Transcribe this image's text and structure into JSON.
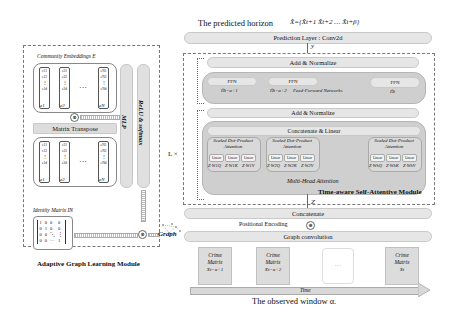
{
  "left_module": {
    "title": "Adaptive Graph Learning Module",
    "community_embeddings_label": "Community Embeddings  E",
    "columns_top": [
      {
        "cells": [
          "e11",
          "e12",
          "⋮",
          "e1d"
        ],
        "label": "e1"
      },
      {
        "cells": [
          "e21",
          "e22",
          "⋮",
          "e2d"
        ],
        "label": "e2"
      },
      {
        "cells": [
          "eN1",
          "eN2",
          "⋮",
          "eNd"
        ],
        "label": "eN"
      }
    ],
    "ellipsis": "···",
    "matrix_transpose_label": "Matrix Transpose",
    "columns_bottom": [
      {
        "cells": [
          "e11",
          "e12",
          "⋮",
          "e1d"
        ],
        "label": "e1"
      },
      {
        "cells": [
          "e21",
          "e22",
          "⋮",
          "e2d"
        ],
        "label": "e2"
      },
      {
        "cells": [
          "eN1",
          "eN2",
          "⋮",
          "eNd"
        ],
        "label": "eN"
      }
    ],
    "mlp_label": "MLP",
    "relu_softmax_label": "ReLU & softmax",
    "identity_matrix_label": "Identity Matrix  IN",
    "identity_matrix_rows": [
      [
        "1",
        "0",
        "0",
        "0"
      ],
      [
        "0",
        "1",
        "0",
        "0"
      ],
      [
        "0",
        "0",
        "⋱",
        "⋮"
      ],
      [
        "0",
        "0",
        "···",
        "1"
      ]
    ],
    "multiply_symbol": "⊗",
    "graph_label": "Graph"
  },
  "right_module": {
    "predicted_horizon_label": "The predicted horizon",
    "predicted_horizon_formula": "X̂={X̂t+1  X̂t+2  …  X̂t+β}",
    "prediction_layer_label": "Prediction Layer : Conv2d",
    "y_label": "y",
    "l_times": "L ×",
    "add_normalize_top": "Add & Normalize",
    "ffn_blocks": [
      {
        "label": "FFN",
        "sub": "Ĥt−α+1"
      },
      {
        "label": "FFN",
        "sub": "Ĥt−α+2"
      },
      {
        "label": "FFN",
        "sub": "Ĥt"
      }
    ],
    "ffn_caption": "Feed-Forward Networks",
    "add_normalize_bottom": "Add & Normalize",
    "concat_linear_label": "Concatenate & Linear",
    "sdpa_blocks": [
      {
        "title": "Scaled Dot-Product Attention",
        "linear": [
          "Linear",
          "Linear",
          "Linear"
        ],
        "formulas": [
          "Z·W1Q",
          "Z·W1K",
          "Z·W1V"
        ]
      },
      {
        "title": "Scaled Dot-Product Attention",
        "linear": [
          "Linear",
          "Linear",
          "Linear"
        ],
        "formulas": [
          "Z·W2Q",
          "Z·W2K",
          "Z·W2V"
        ]
      },
      {
        "title": "Scaled Dot-Product Attention",
        "linear": [
          "Linear",
          "Linear",
          "Linear"
        ],
        "formulas": [
          "Z·WhQ",
          "Z·WhK",
          "Z·WhV"
        ]
      }
    ],
    "multi_head_label": "Multi-Head Attention",
    "module_title": "Time-aware Self-Attentive Module",
    "z_label": "Z",
    "concatenate_label": "Concatenate",
    "positional_encoding_label": "Positional Encoding",
    "plus_symbol": "⊕",
    "graph_convolution_label": "Graph convolution",
    "crime_matrices": [
      {
        "label": "Crime Matrix",
        "sub": "Xt−α+1"
      },
      {
        "label": "Crime Matrix",
        "sub": "Xt−α+2"
      },
      {
        "label": "···",
        "sub": ""
      },
      {
        "label": "Crime Matrix",
        "sub": "Xt"
      }
    ],
    "time_label": "Time",
    "observed_window_label": "The observed window α."
  },
  "colors": {
    "pill_fill": "#e6e6e6",
    "dark_group_fill": "#cfcfcf",
    "crime_fill": "#dcdcdc",
    "dash_border": "#777777"
  }
}
